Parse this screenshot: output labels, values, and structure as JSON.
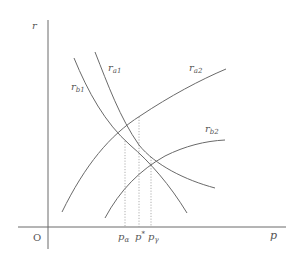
{
  "diagram": {
    "axes": {
      "y_label": "r",
      "x_label": "p",
      "origin_label": "O"
    },
    "curves": [
      {
        "id": "r_b1",
        "label_main": "r",
        "label_sub": "b1",
        "shape": "downward sloping, convex"
      },
      {
        "id": "r_a1",
        "label_main": "r",
        "label_sub": "a1",
        "shape": "downward sloping, convex"
      },
      {
        "id": "r_a2",
        "label_main": "r",
        "label_sub": "a2",
        "shape": "upward sloping, concave"
      },
      {
        "id": "r_b2",
        "label_main": "r",
        "label_sub": "b2",
        "shape": "upward sloping, concave"
      }
    ],
    "x_ticks": [
      {
        "id": "p_alpha",
        "main": "p",
        "sub": "α"
      },
      {
        "id": "p_star",
        "main": "p",
        "sup": "*"
      },
      {
        "id": "p_gamma",
        "main": "p",
        "sub": "γ"
      }
    ],
    "colors": {
      "line": "#6a6a6a",
      "guide": "#9a9a9a",
      "text": "#555555",
      "background": "#ffffff"
    }
  }
}
